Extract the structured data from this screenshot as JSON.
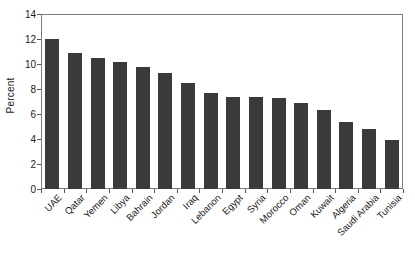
{
  "chart_data": {
    "type": "bar",
    "title": "",
    "xlabel": "",
    "ylabel": "Percent",
    "ylim": [
      0,
      14
    ],
    "ytick_step": 2,
    "yticks": [
      "0",
      "2",
      "4",
      "6",
      "8",
      "10",
      "12",
      "14"
    ],
    "grid": false,
    "legend": null,
    "bar_color": "#3a3a3a",
    "frame_color": "#7d7d7d",
    "categories": [
      "UAE",
      "Qatar",
      "Yemen",
      "Libya",
      "Bahrain",
      "Jordan",
      "Iraq",
      "Lebanon",
      "Egypt",
      "Syria",
      "Morocco",
      "Oman",
      "Kuwait",
      "Algeria",
      "Saudi Arabia",
      "Tunisia"
    ],
    "values": [
      12.0,
      10.9,
      10.45,
      10.15,
      9.75,
      9.3,
      8.5,
      7.7,
      7.4,
      7.35,
      7.3,
      6.9,
      6.3,
      5.4,
      4.8,
      3.9
    ]
  }
}
